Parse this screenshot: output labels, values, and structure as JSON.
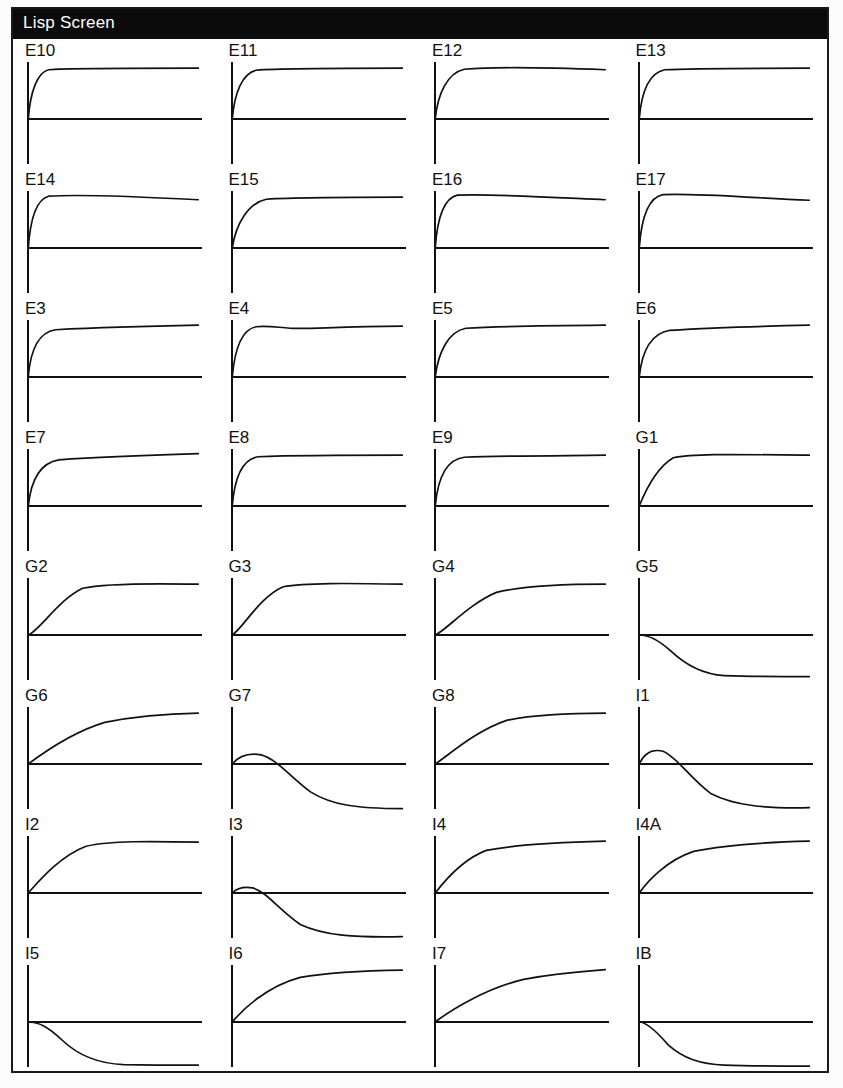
{
  "window": {
    "title": "Lisp Screen",
    "title_bar_color": "#0b0b0b",
    "title_text_color": "#ffffff",
    "border_color": "#1a1a1a",
    "background_color": "#ffffff"
  },
  "chart_data": {
    "type": "line",
    "title": "Lisp Screen",
    "grid": {
      "columns": 4,
      "rows": 8,
      "count": 32
    },
    "axes": {
      "grid_on": false,
      "x_axis_label": "",
      "y_axis_label": "",
      "tick_labels": [],
      "legend": "none",
      "x_origin_frac": 0.075,
      "y_origin_frac": 0.62,
      "x_end_frac": 0.93,
      "y_top_frac": 0.18,
      "y_bottom_frac": 0.97
    },
    "line_color": "#111111",
    "panels": [
      {
        "label": "E10",
        "shape": "first-order rise, fast, flat plateau",
        "path": "M0,0 C0.012,0.55 0.055,0.92 0.12,0.97 C0.22,1.00 0.45,1.00 1,1.0"
      },
      {
        "label": "E11",
        "shape": "first-order rise, fast, flat plateau",
        "path": "M0,0 C0.013,0.52 0.06,0.90 0.14,0.96 C0.25,0.99 0.5,1.00 1,1.0"
      },
      {
        "label": "E12",
        "shape": "rise with very slight droop",
        "path": "M0,0 C0.015,0.50 0.07,0.90 0.17,0.98 C0.35,1.03 0.6,1.02 1,0.97"
      },
      {
        "label": "E13",
        "shape": "first-order rise, fast",
        "path": "M0,0 C0.013,0.54 0.06,0.91 0.15,0.97 C0.3,1.00 0.55,1.00 1,1.0"
      },
      {
        "label": "E14",
        "shape": "fast rise with slight overshoot then droop",
        "path": "M0,0 C0.012,0.58 0.05,0.96 0.12,1.02 C0.3,1.06 0.6,1.02 1,0.95"
      },
      {
        "label": "E15",
        "shape": "first-order rise, medium, flat plateau",
        "path": "M0,0 C0.02,0.45 0.09,0.88 0.2,0.96 C0.4,1.00 0.65,1.00 1,1.0"
      },
      {
        "label": "E16",
        "shape": "fast rise with overshoot then slow droop",
        "path": "M0,0 C0.012,0.60 0.05,0.98 0.13,1.04 C0.32,1.07 0.62,1.01 1,0.95"
      },
      {
        "label": "E17",
        "shape": "fast rise with clear overshoot then settle",
        "path": "M0,0 C0.013,0.62 0.055,1.00 0.14,1.05 C0.33,1.08 0.6,1.00 1,0.94"
      },
      {
        "label": "E3",
        "shape": "rise then slow continued climb",
        "path": "M0,0 C0.013,0.55 0.06,0.88 0.16,0.93 C0.4,0.97 0.7,1.00 1,1.02"
      },
      {
        "label": "E4",
        "shape": "rise with small ripple on plateau",
        "path": "M0,0 C0.015,0.56 0.06,0.94 0.14,0.99 C0.2,1.02 0.26,0.98 0.34,0.96 C0.45,0.94 0.6,0.99 1,1.0"
      },
      {
        "label": "E5",
        "shape": "first-order rise, medium-fast",
        "path": "M0,0 C0.018,0.50 0.08,0.90 0.18,0.96 C0.38,1.00 0.65,1.01 1,1.02"
      },
      {
        "label": "E6",
        "shape": "rise then slow continued climb",
        "path": "M0,0 C0.016,0.52 0.07,0.86 0.18,0.92 C0.42,0.97 0.7,1.00 1,1.02"
      },
      {
        "label": "E7",
        "shape": "rise then slow continued climb",
        "path": "M0,0 C0.016,0.52 0.07,0.85 0.18,0.91 C0.45,0.97 0.72,1.00 1,1.03"
      },
      {
        "label": "E8",
        "shape": "fast rise then flat slight climb",
        "path": "M0,0 C0.014,0.58 0.06,0.92 0.15,0.97 C0.4,1.00 0.7,1.00 1,1.0"
      },
      {
        "label": "E9",
        "shape": "fast rise then flat plateau",
        "path": "M0,0 C0.015,0.56 0.07,0.92 0.17,0.96 C0.4,0.99 0.7,0.99 1,1.0"
      },
      {
        "label": "G1",
        "shape": "near-linear ramp then sharp plateau",
        "path": "M0,0 C0.03,0.25 0.1,0.75 0.2,0.95 C0.3,1.03 0.5,1.02 1,1.0"
      },
      {
        "label": "G2",
        "shape": "sigmoid rise, medium",
        "path": "M0,0 C0.07,0.10 0.18,0.70 0.32,0.92 C0.45,1.02 0.7,1.02 1,1.0"
      },
      {
        "label": "G3",
        "shape": "sigmoid rise, medium-fast",
        "path": "M0,0 C0.06,0.12 0.16,0.75 0.3,0.95 C0.42,1.03 0.68,1.02 1,1.0"
      },
      {
        "label": "G4",
        "shape": "rounded rise, slower",
        "path": "M0,0 C0.06,0.08 0.2,0.62 0.36,0.84 C0.52,0.97 0.75,1.00 1,1.0"
      },
      {
        "label": "G5",
        "shape": "flat then decays below axis to negative plateau",
        "path": "M0,0 C0.05,0.00 0.10,-0.06 0.18,-0.30 C0.28,-0.62 0.38,-0.78 0.5,-0.80 C0.68,-0.82 0.85,-0.82 1,-0.82"
      },
      {
        "label": "G6",
        "shape": "rounded rise, slow, still climbing",
        "path": "M0,0 C0.08,0.20 0.25,0.62 0.45,0.82 C0.65,0.95 0.85,0.99 1,1.0"
      },
      {
        "label": "G7",
        "shape": "small positive bump then decay to negative plateau",
        "path": "M0,0 C0.04,0.16 0.10,0.22 0.17,0.18 C0.26,0.10 0.34,-0.25 0.46,-0.55 C0.58,-0.80 0.72,-0.88 1,-0.88"
      },
      {
        "label": "G8",
        "shape": "rounded rise, medium-slow",
        "path": "M0,0 C0.08,0.18 0.24,0.66 0.42,0.86 C0.6,0.98 0.82,1.00 1,1.0"
      },
      {
        "label": "I1",
        "shape": "positive overshoot bump then decay below axis",
        "path": "M0,0 C0.03,0.22 0.08,0.30 0.14,0.25 C0.22,0.14 0.3,-0.28 0.42,-0.58 C0.56,-0.82 0.74,-0.88 1,-0.86"
      },
      {
        "label": "I2",
        "shape": "sigmoid rise, medium, flat plateau",
        "path": "M0,0 C0.05,0.18 0.18,0.72 0.34,0.92 C0.48,1.03 0.72,1.02 1,1.0"
      },
      {
        "label": "I3",
        "shape": "tiny bump then steep descent to negative plateau",
        "path": "M0,0 C0.03,0.10 0.07,0.13 0.12,0.10 C0.2,0.03 0.28,-0.35 0.4,-0.62 C0.54,-0.84 0.72,-0.88 1,-0.86"
      },
      {
        "label": "I4",
        "shape": "rise with rounded knee then slow climb",
        "path": "M0,0 C0.05,0.22 0.16,0.66 0.3,0.84 C0.5,0.97 0.75,1.00 1,1.02"
      },
      {
        "label": "I4A",
        "shape": "rise with rounded knee then slow climb",
        "path": "M0,0 C0.05,0.24 0.16,0.64 0.32,0.82 C0.52,0.96 0.76,1.00 1,1.02"
      },
      {
        "label": "I5",
        "shape": "flat then sigmoid descent to negative plateau",
        "path": "M0,0 C0.06,0.00 0.11,-0.08 0.2,-0.36 C0.3,-0.68 0.42,-0.82 0.56,-0.84 C0.74,-0.85 0.88,-0.85 1,-0.85"
      },
      {
        "label": "I6",
        "shape": "rounded rise, medium-slow",
        "path": "M0,0 C0.06,0.24 0.2,0.70 0.4,0.88 C0.6,0.99 0.82,1.01 1,1.02"
      },
      {
        "label": "I7",
        "shape": "slow rise, still climbing at end",
        "path": "M0,0 C0.1,0.26 0.3,0.66 0.52,0.84 C0.72,0.96 0.88,1.00 1,1.03"
      },
      {
        "label": "IB",
        "shape": "immediate descent to negative plateau",
        "path": "M0,0 C0.04,0.00 0.09,-0.14 0.17,-0.45 C0.26,-0.72 0.36,-0.83 0.5,-0.85 C0.68,-0.87 0.86,-0.87 1,-0.87"
      }
    ]
  }
}
